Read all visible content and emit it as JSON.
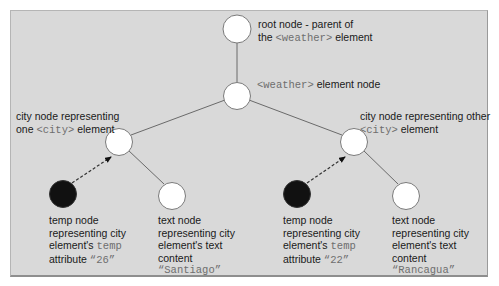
{
  "diagram": {
    "background": "#d9d9d9",
    "node_fill_element": "#ffffff",
    "node_fill_attribute": "#111111",
    "nodes": {
      "root": {
        "label_line1": "root node - parent of",
        "label_line2_pre": "the ",
        "label_line2_code": "<weather>",
        "label_line2_post": " element"
      },
      "weather": {
        "label_code": "<weather>",
        "label_post": " element node"
      },
      "city_left": {
        "label_line1": "city node representing",
        "label_line2_pre": "one ",
        "label_line2_code": "<city>",
        "label_line2_post": " element"
      },
      "city_right": {
        "label_line1": "city node representing other",
        "label_line2_code": "<city>",
        "label_line2_post": " element"
      },
      "temp_left": {
        "line1": "temp node",
        "line2": "representing city",
        "line3_pre": "element's ",
        "line3_code": "temp",
        "line4_pre": "attribute ",
        "line4_code": "“26”"
      },
      "text_left": {
        "line1": "text node",
        "line2": "representing city",
        "line3": "element's text",
        "line4": "content",
        "line5_code": "“Santiago”"
      },
      "temp_right": {
        "line1": "temp node",
        "line2": "representing city",
        "line3_pre": "element's ",
        "line3_code": "temp",
        "line4_pre": "attribute ",
        "line4_code": "“22”"
      },
      "text_right": {
        "line1": "text node",
        "line2": "representing city",
        "line3": "element's text",
        "line4": "content",
        "line5_code": "“Rancagua”"
      }
    }
  }
}
